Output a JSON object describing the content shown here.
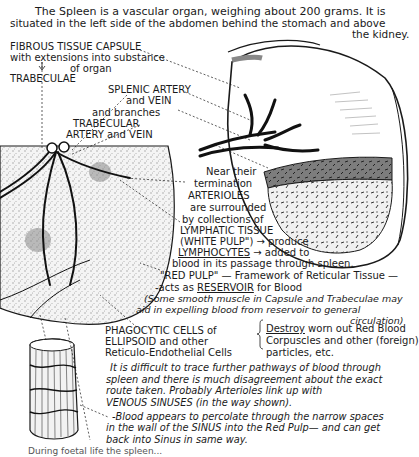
{
  "intro": {
    "line1": "The Spleen is a vascular organ, weighing about 200 grams.  It is",
    "line2": "situated in the left side of the abdomen behind the stomach and above",
    "line3": "the kidney."
  },
  "labels": {
    "capsule_1": "FIBROUS TISSUE CAPSULE",
    "capsule_2": "with extensions into substance",
    "capsule_3": "of organ",
    "trabeculae": "TRABECULAE",
    "splenic_1": "SPLENIC ARTERY",
    "splenic_2": "and VEIN",
    "splenic_3": "and   branches",
    "trab_1": "TRABECULAR",
    "trab_2": "ARTERY and VEIN",
    "arterioles_1": "Near their",
    "arterioles_2": "termination",
    "arterioles_3": "ARTERIOLES",
    "arterioles_4": "are surrounded",
    "arterioles_5": "by collections of",
    "arterioles_6": "LYMPHATIC TISSUE",
    "arterioles_7a": "(WHITE PULP\")",
    "arterioles_7b": "→ produce",
    "arterioles_8a": "LYMPHOCYTES",
    "arterioles_8b": "→ added to",
    "arterioles_9": "blood in its passage through spleen.",
    "redpulp_1": "\"RED PULP\" — Framework of Reticular Tissue —",
    "redpulp_2a": "-acts as ",
    "redpulp_2b": "RESERVOIR",
    "redpulp_2c": " for Blood",
    "muscle_1": "(Some smooth muscle in Capsule and Trabeculae may",
    "muscle_2": "aid in expelling blood from reservoir to general",
    "muscle_3": "circulation)",
    "phago_1": "PHAGOCYTIC CELLS of",
    "phago_2": "ELLIPSOID and other",
    "phago_3": "Reticulo-Endothelial Cells",
    "destroy_1a": "Destroy",
    "destroy_1b": " worn out  Red Blood",
    "destroy_2": "Corpuscles  and other (foreign)",
    "destroy_3": "particles, etc.",
    "pathway_1": "It is difficult to trace further pathways of blood through",
    "pathway_2": "spleen and there is much disagreement about the exact",
    "pathway_3": "route taken.    Probably Arterioles link up with",
    "pathway_4": "VENOUS SINUSES  (in the way shown).",
    "percolate_1": "-Blood appears to percolate through the narrow spaces",
    "percolate_2": "in the wall of the SINUS into the Red Pulp— and can get",
    "percolate_3": "back into Sinus in same way.",
    "footer_cut": "During foetal life the spleen..."
  },
  "colors": {
    "ink": "#1a1a1a",
    "paper": "#ffffff",
    "stipple": "#bdbdbd",
    "cut_face": "#8a8a8a"
  }
}
